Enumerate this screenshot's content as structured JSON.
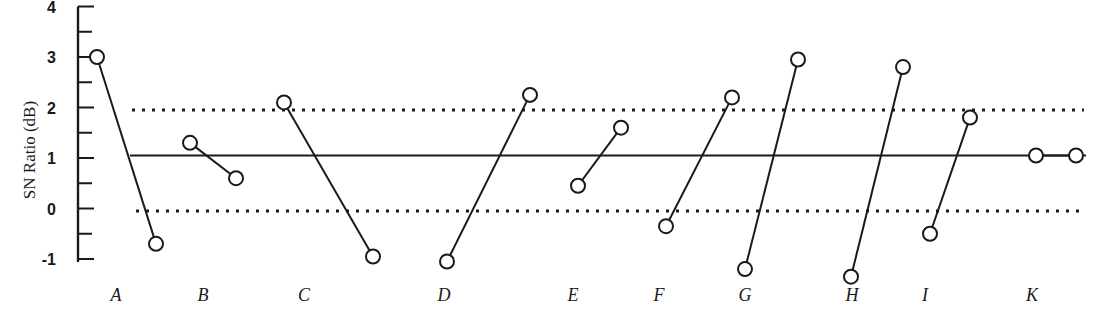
{
  "chart_data": {
    "type": "line",
    "title": "",
    "xlabel": "",
    "ylabel": "SN Ratio (dB)",
    "ylim": [
      -1,
      4
    ],
    "yticks": [
      4,
      3,
      2,
      1,
      0,
      -1
    ],
    "ytick_labels": [
      "4",
      "3",
      "2",
      "1",
      "0",
      "-1"
    ],
    "grid": false,
    "legend": null,
    "categories": [
      "A",
      "B",
      "C",
      "D",
      "E",
      "F",
      "G",
      "H",
      "I",
      "K"
    ],
    "factors": [
      {
        "name": "A",
        "level1": 3.0,
        "level2": -0.7
      },
      {
        "name": "B",
        "level1": 1.3,
        "level2": 0.6
      },
      {
        "name": "C",
        "level1": 2.1,
        "level2": -0.95
      },
      {
        "name": "D",
        "level1": -1.05,
        "level2": 2.25
      },
      {
        "name": "E",
        "level1": 0.45,
        "level2": 1.6
      },
      {
        "name": "F",
        "level1": -0.35,
        "level2": 2.2
      },
      {
        "name": "G",
        "level1": -1.2,
        "level2": 2.95
      },
      {
        "name": "H",
        "level1": -1.35,
        "level2": 2.8
      },
      {
        "name": "I",
        "level1": -0.5,
        "level2": 1.8
      },
      {
        "name": "K",
        "level1": 1.05,
        "level2": 1.05
      }
    ],
    "reference_lines": {
      "mean": 1.05,
      "upper_limit": 1.95,
      "lower_limit": -0.05
    }
  }
}
